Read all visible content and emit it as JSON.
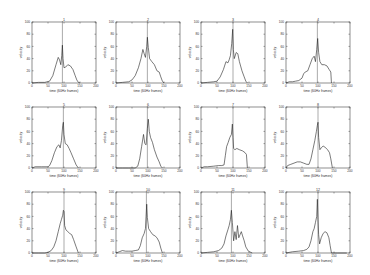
{
  "figure": {
    "rows": 3,
    "cols": 4,
    "panel_left": [
      32,
      116,
      201,
      286
    ],
    "panel_top": [
      22,
      107,
      192
    ],
    "panel_width": 64,
    "panel_height": 61
  },
  "chart_data": [
    {
      "type": "line",
      "title": "1",
      "xlabel": "time (60Hz frames)",
      "ylabel": "velocity",
      "xlim": [
        0,
        200
      ],
      "ylim": [
        0,
        100
      ],
      "xticks": [
        0,
        50,
        100,
        150,
        200
      ],
      "yticks": [
        0,
        20,
        40,
        60,
        80,
        100
      ],
      "vline": 95,
      "x": [
        0,
        20,
        40,
        55,
        65,
        75,
        82,
        86,
        90,
        93,
        95,
        97,
        100,
        105,
        112,
        120,
        128,
        135,
        140,
        145,
        150
      ],
      "y": [
        0,
        1,
        1,
        3,
        12,
        30,
        42,
        38,
        30,
        45,
        62,
        40,
        25,
        26,
        30,
        28,
        22,
        12,
        5,
        1,
        0
      ]
    },
    {
      "type": "line",
      "title": "2",
      "xlabel": "time (60Hz frames)",
      "ylabel": "velocity",
      "xlim": [
        0,
        200
      ],
      "ylim": [
        0,
        100
      ],
      "xticks": [
        0,
        50,
        100,
        150,
        200
      ],
      "yticks": [
        0,
        20,
        40,
        60,
        80,
        100
      ],
      "vline": 98,
      "x": [
        0,
        20,
        40,
        50,
        60,
        70,
        78,
        84,
        88,
        92,
        96,
        98,
        101,
        105,
        112,
        120,
        128,
        135,
        140,
        145,
        150
      ],
      "y": [
        0,
        1,
        2,
        5,
        12,
        25,
        40,
        55,
        48,
        42,
        60,
        75,
        58,
        40,
        35,
        30,
        20,
        18,
        10,
        3,
        0
      ]
    },
    {
      "type": "line",
      "title": "3",
      "xlabel": "time (60Hz frames)",
      "ylabel": "velocity",
      "xlim": [
        0,
        200
      ],
      "ylim": [
        0,
        100
      ],
      "xticks": [
        0,
        50,
        100,
        150,
        200
      ],
      "yticks": [
        0,
        20,
        40,
        60,
        80,
        100
      ],
      "vline": 100,
      "x": [
        0,
        20,
        40,
        50,
        60,
        70,
        78,
        84,
        88,
        92,
        96,
        99,
        101,
        104,
        110,
        115,
        120,
        128,
        135,
        140,
        145
      ],
      "y": [
        0,
        1,
        2,
        3,
        10,
        22,
        35,
        33,
        38,
        45,
        65,
        88,
        55,
        40,
        50,
        48,
        35,
        20,
        10,
        3,
        0
      ]
    },
    {
      "type": "line",
      "title": "4",
      "xlabel": "time (60Hz frames)",
      "ylabel": "velocity",
      "xlim": [
        0,
        200
      ],
      "ylim": [
        0,
        100
      ],
      "xticks": [
        0,
        50,
        100,
        150,
        200
      ],
      "yticks": [
        0,
        20,
        40,
        60,
        80,
        100
      ],
      "vline": 98,
      "x": [
        0,
        10,
        20,
        30,
        40,
        50,
        55,
        60,
        68,
        75,
        82,
        88,
        92,
        96,
        99,
        102,
        106,
        112,
        120,
        128,
        135,
        140,
        142
      ],
      "y": [
        0,
        2,
        2,
        3,
        4,
        8,
        15,
        18,
        20,
        30,
        40,
        44,
        35,
        55,
        73,
        50,
        35,
        30,
        30,
        28,
        22,
        18,
        0
      ]
    },
    {
      "type": "line",
      "title": "5",
      "xlabel": "time (60Hz frames)",
      "ylabel": "velocity",
      "xlim": [
        0,
        200
      ],
      "ylim": [
        0,
        100
      ],
      "xticks": [
        0,
        50,
        100,
        150,
        200
      ],
      "yticks": [
        0,
        20,
        40,
        60,
        80,
        100
      ],
      "vline": 98,
      "x": [
        0,
        10,
        30,
        50,
        55,
        62,
        70,
        78,
        84,
        88,
        92,
        96,
        98,
        100,
        104,
        110,
        116,
        122,
        130,
        138,
        145
      ],
      "y": [
        0,
        2,
        2,
        2,
        4,
        12,
        25,
        35,
        38,
        33,
        45,
        70,
        75,
        55,
        40,
        38,
        32,
        25,
        15,
        5,
        0
      ]
    },
    {
      "type": "line",
      "title": "6",
      "xlabel": "time (60Hz frames)",
      "ylabel": "velocity",
      "xlim": [
        0,
        200
      ],
      "ylim": [
        0,
        100
      ],
      "xticks": [
        0,
        50,
        100,
        150,
        200
      ],
      "yticks": [
        0,
        20,
        40,
        60,
        80,
        100
      ],
      "vline": 98,
      "x": [
        0,
        20,
        40,
        60,
        68,
        74,
        80,
        86,
        90,
        94,
        98,
        101,
        104,
        108,
        114,
        120,
        128,
        135,
        140,
        145
      ],
      "y": [
        0,
        0,
        0,
        0,
        3,
        15,
        35,
        55,
        40,
        38,
        65,
        80,
        60,
        50,
        42,
        30,
        18,
        10,
        3,
        0
      ]
    },
    {
      "type": "line",
      "title": "7",
      "xlabel": "time (60Hz frames)",
      "ylabel": "velocity",
      "xlim": [
        0,
        200
      ],
      "ylim": [
        0,
        100
      ],
      "xticks": [
        0,
        50,
        100,
        150,
        200
      ],
      "yticks": [
        0,
        20,
        40,
        60,
        80,
        100
      ],
      "vline": 100,
      "x": [
        0,
        10,
        20,
        40,
        55,
        65,
        72,
        76,
        80,
        85,
        90,
        95,
        98,
        100,
        102,
        106,
        112,
        120,
        130,
        138,
        142,
        145
      ],
      "y": [
        0,
        2,
        2,
        3,
        4,
        4,
        5,
        20,
        35,
        42,
        50,
        55,
        72,
        50,
        32,
        30,
        32,
        30,
        28,
        25,
        22,
        0
      ]
    },
    {
      "type": "line",
      "title": "8",
      "xlabel": "time (60Hz frames)",
      "ylabel": "velocity",
      "xlim": [
        0,
        200
      ],
      "ylim": [
        0,
        100
      ],
      "xticks": [
        0,
        50,
        100,
        150,
        200
      ],
      "yticks": [
        0,
        20,
        40,
        60,
        80,
        100
      ],
      "vline": 100,
      "x": [
        0,
        5,
        15,
        25,
        35,
        45,
        55,
        65,
        72,
        78,
        84,
        90,
        95,
        98,
        100,
        102,
        106,
        110,
        116,
        122,
        130,
        136,
        140,
        145
      ],
      "y": [
        0,
        4,
        6,
        8,
        10,
        10,
        8,
        6,
        6,
        15,
        30,
        45,
        60,
        70,
        75,
        50,
        30,
        33,
        36,
        34,
        30,
        25,
        15,
        0
      ]
    },
    {
      "type": "line",
      "title": "9",
      "xlabel": "time (60Hz frames)",
      "ylabel": "velocity",
      "xlim": [
        0,
        200
      ],
      "ylim": [
        0,
        100
      ],
      "xticks": [
        0,
        50,
        100,
        150,
        200
      ],
      "yticks": [
        0,
        20,
        40,
        60,
        80,
        100
      ],
      "vline": 100,
      "x": [
        0,
        20,
        40,
        50,
        60,
        68,
        75,
        82,
        88,
        92,
        96,
        98,
        100,
        102,
        106,
        112,
        118,
        124,
        130,
        138,
        145
      ],
      "y": [
        0,
        0,
        0,
        1,
        4,
        10,
        20,
        35,
        48,
        55,
        62,
        70,
        68,
        45,
        38,
        35,
        32,
        30,
        22,
        10,
        0
      ]
    },
    {
      "type": "line",
      "title": "10",
      "xlabel": "time (60Hz frames)",
      "ylabel": "velocity",
      "xlim": [
        0,
        200
      ],
      "ylim": [
        0,
        100
      ],
      "xticks": [
        0,
        50,
        100,
        150,
        200
      ],
      "yticks": [
        0,
        20,
        40,
        60,
        80,
        100
      ],
      "vline": 95,
      "x": [
        0,
        10,
        20,
        30,
        40,
        50,
        60,
        70,
        76,
        82,
        88,
        92,
        94,
        96,
        98,
        102,
        108,
        115,
        122,
        128,
        135,
        140,
        145
      ],
      "y": [
        0,
        2,
        4,
        3,
        3,
        3,
        4,
        5,
        12,
        25,
        32,
        40,
        60,
        80,
        58,
        40,
        35,
        30,
        28,
        25,
        18,
        8,
        0
      ]
    },
    {
      "type": "line",
      "title": "11",
      "xlabel": "time (60Hz frames)",
      "ylabel": "velocity",
      "xlim": [
        0,
        200
      ],
      "ylim": [
        0,
        100
      ],
      "xticks": [
        0,
        50,
        100,
        150,
        200
      ],
      "yticks": [
        0,
        20,
        40,
        60,
        80,
        100
      ],
      "vline": 95,
      "x": [
        0,
        20,
        40,
        55,
        65,
        72,
        78,
        84,
        88,
        92,
        95,
        98,
        102,
        106,
        110,
        114,
        118,
        122,
        126,
        130,
        135,
        140,
        148,
        160
      ],
      "y": [
        0,
        1,
        2,
        4,
        8,
        15,
        28,
        38,
        45,
        55,
        70,
        50,
        20,
        35,
        22,
        45,
        25,
        30,
        35,
        28,
        20,
        10,
        3,
        0
      ]
    },
    {
      "type": "line",
      "title": "12",
      "xlabel": "time (60Hz frames)",
      "ylabel": "velocity",
      "xlim": [
        0,
        200
      ],
      "ylim": [
        0,
        100
      ],
      "xticks": [
        0,
        50,
        100,
        150,
        200
      ],
      "yticks": [
        0,
        20,
        40,
        60,
        80,
        100
      ],
      "vline": 100,
      "x": [
        0,
        20,
        40,
        55,
        65,
        72,
        78,
        84,
        88,
        92,
        96,
        98,
        100,
        102,
        105,
        110,
        116,
        122,
        128,
        134,
        138,
        142,
        160,
        190
      ],
      "y": [
        0,
        2,
        3,
        4,
        6,
        10,
        20,
        35,
        40,
        50,
        60,
        88,
        55,
        30,
        15,
        25,
        32,
        35,
        33,
        25,
        12,
        0,
        0,
        0
      ]
    }
  ]
}
